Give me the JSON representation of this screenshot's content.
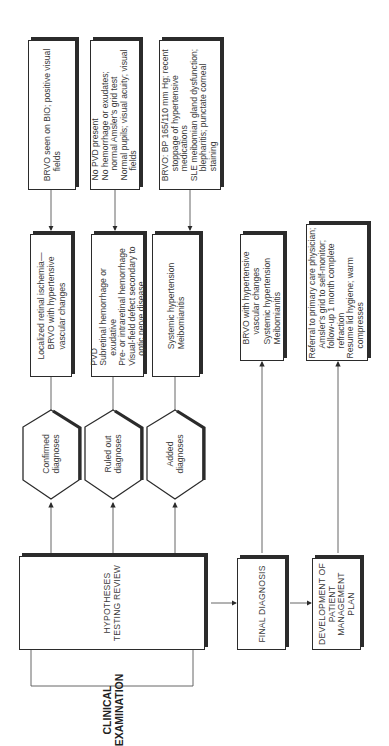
{
  "diagram": {
    "orientation": "rotated-90-ccw",
    "clinical_examination": {
      "label_lines": [
        "CLINICAL",
        "EXAMINATION"
      ]
    },
    "hypotheses_review": {
      "label_lines": [
        "HYPOTHESES",
        "TESTING REVIEW"
      ]
    },
    "final_diagnosis": {
      "label_lines": [
        "FINAL DIAGNOSIS"
      ]
    },
    "management_plan": {
      "label_lines": [
        "DEVELOPMENT OF",
        "PATIENT",
        "MANAGEMENT",
        "PLAN"
      ]
    },
    "branches": [
      {
        "hexagon": {
          "label_lines": [
            "Confirmed",
            "diagnoses"
          ]
        },
        "result": {
          "lines": [
            "Localized retinal ischemia—",
            "BRVO with hypertensive",
            "vascular changes"
          ]
        },
        "evidence": {
          "lines": [
            "BRVO seen on BIO; positive visual",
            "fields"
          ]
        }
      },
      {
        "hexagon": {
          "label_lines": [
            "Ruled out",
            "diagnoses"
          ]
        },
        "result": {
          "lines": [
            "PVD",
            "Subretinal hemorrhage or",
            "exudative",
            "Pre- or intraretinal hemorrhage",
            "Visual-field defect secondary to",
            "optic nerve disease"
          ]
        },
        "evidence": {
          "lines": [
            "No PVD present",
            "No hemorrhage or exudates;",
            "normal Amsler's grid test",
            "Normal pupils; visual acuity; visual",
            "fields"
          ]
        }
      },
      {
        "hexagon": {
          "label_lines": [
            "Added",
            "diagnoses"
          ]
        },
        "result": {
          "lines": [
            "Systemic hypertension",
            "Meibomianitis"
          ]
        },
        "evidence": {
          "lines": [
            "BRVO: BP 165/110 mm Hg; recent",
            "stoppage of hypertensive",
            "medications",
            "SLE meibomian gland dysfunction;",
            "blepharitis; punctate corneal",
            "staining"
          ]
        }
      }
    ],
    "final_diagnosis_detail": {
      "lines": [
        "BRVO with hypertensive",
        "vascular changes",
        "Systemic hypertension",
        "Meibomianitis"
      ]
    },
    "management_detail": {
      "lines": [
        "Referral to primary care physician;",
        "Amsler's grid to self-monitor;",
        "follow-up 1 month complete",
        "refraction",
        "Resume lid hygiene; warm",
        "compresses"
      ]
    }
  },
  "colors": {
    "line": "#2b2b2b",
    "text": "#3a3a3a",
    "background": "#ffffff"
  }
}
